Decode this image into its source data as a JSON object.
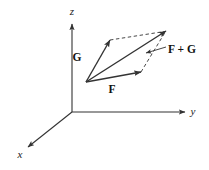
{
  "figure": {
    "background_color": "#ffffff",
    "line_color": "#333333",
    "text_color": "#111111"
  },
  "axes": [
    {
      "name": "z",
      "label": "z",
      "label_x": 72,
      "label_y": 15,
      "from_x": 72,
      "from_y": 112,
      "to_x": 72,
      "to_y": 24
    },
    {
      "name": "y",
      "label": "y",
      "label_x": 193,
      "label_y": 115,
      "from_x": 72,
      "from_y": 112,
      "to_x": 185,
      "to_y": 112
    },
    {
      "name": "x",
      "label": "x",
      "label_x": 20,
      "label_y": 158,
      "from_x": 72,
      "from_y": 112,
      "to_x": 28,
      "to_y": 147
    }
  ],
  "vectors": [
    {
      "name": "G",
      "label": "G",
      "label_x": 77,
      "label_y": 61,
      "from_x": 86,
      "from_y": 82,
      "to_x": 110,
      "to_y": 40,
      "style": "solid"
    },
    {
      "name": "F",
      "label": "F",
      "label_x": 112,
      "label_y": 93,
      "from_x": 86,
      "from_y": 82,
      "to_x": 141,
      "to_y": 72,
      "style": "solid"
    },
    {
      "name": "F+G",
      "label": "F + G",
      "label_x": 168,
      "label_y": 53,
      "from_x": 86,
      "from_y": 82,
      "to_x": 166,
      "to_y": 31,
      "style": "solid"
    }
  ],
  "construction_lines": [
    {
      "name": "dashed-g-to-resultant",
      "from_x": 110,
      "from_y": 40,
      "to_x": 166,
      "to_y": 31,
      "style": "dashed"
    },
    {
      "name": "dashed-f-to-resultant",
      "from_x": 141,
      "from_y": 72,
      "to_x": 166,
      "to_y": 31,
      "style": "dashed"
    }
  ],
  "leader_line": {
    "name": "resultant-leader",
    "from_x": 166,
    "from_y": 47,
    "to_x": 146,
    "to_y": 53
  },
  "origin": {
    "x": 72,
    "y": 112
  },
  "vector_origin": {
    "x": 86,
    "y": 82
  }
}
